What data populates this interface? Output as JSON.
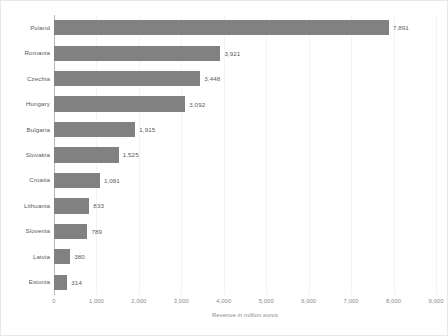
{
  "chart_data": {
    "type": "bar",
    "orientation": "horizontal",
    "title": "",
    "xlabel": "Revenue in million euros",
    "ylabel": "",
    "xlim": [
      0,
      9000
    ],
    "grid": true,
    "legend": null,
    "xticks": [
      "0",
      "1,000",
      "2,000",
      "3,000",
      "4,000",
      "5,000",
      "6,000",
      "7,000",
      "8,000",
      "9,000"
    ],
    "xtick_values": [
      0,
      1000,
      2000,
      3000,
      4000,
      5000,
      6000,
      7000,
      8000,
      9000
    ],
    "categories": [
      "Poland",
      "Romania",
      "Czechia",
      "Hungary",
      "Bulgaria",
      "Slovakia",
      "Croatia",
      "Lithuania",
      "Slovenia",
      "Latvia",
      "Estonia"
    ],
    "values": [
      7891,
      3921,
      3448,
      3092,
      1915,
      1525,
      1081,
      833,
      789,
      380,
      314
    ],
    "data_labels": [
      "7,891",
      "3,921",
      "3,448",
      "3,092",
      "1,915",
      "1,525",
      "1,081",
      "833",
      "789",
      "380",
      "314"
    ],
    "bar_color": "#818181",
    "grid_color": "#f4f4f4",
    "axis_color": "#b8b8b8",
    "text_color": "#5a5a5a",
    "tick_text_color": "#8a8a8a",
    "background_color": "#ffffff"
  }
}
